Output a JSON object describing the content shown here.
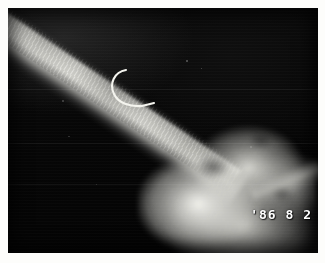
{
  "image": {
    "type": "radiograph",
    "modality": "x-ray",
    "orientation": "landscape",
    "background_color": "#ffffff",
    "plate_color": "#050505",
    "bone_color": "#e8e8e2",
    "stamp_color": "#ffffff"
  },
  "overlay": {
    "date_stamp": "'86 8 2",
    "year": "'86",
    "month": "8",
    "day": "2"
  },
  "features": [
    {
      "name": "bone-shaft",
      "description": "diagonal bone shaft from upper-left to lower-right"
    },
    {
      "name": "joint-mass",
      "description": "bright joint and paw mass in lower-right quadrant"
    },
    {
      "name": "wire-hook-artifact",
      "description": "curved radiopaque wire hook in upper-middle field"
    }
  ]
}
